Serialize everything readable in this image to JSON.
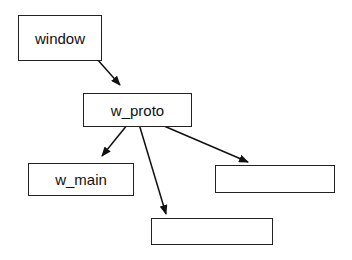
{
  "diagram": {
    "nodes": [
      {
        "id": "window",
        "label": "window"
      },
      {
        "id": "w_proto",
        "label": "w_proto"
      },
      {
        "id": "w_main",
        "label": "w_main"
      },
      {
        "id": "empty_right",
        "label": ""
      },
      {
        "id": "empty_bottom",
        "label": ""
      }
    ],
    "edges": [
      {
        "from": "window",
        "to": "w_proto"
      },
      {
        "from": "w_proto",
        "to": "w_main"
      },
      {
        "from": "w_proto",
        "to": "empty_bottom"
      },
      {
        "from": "w_proto",
        "to": "empty_right"
      }
    ]
  }
}
